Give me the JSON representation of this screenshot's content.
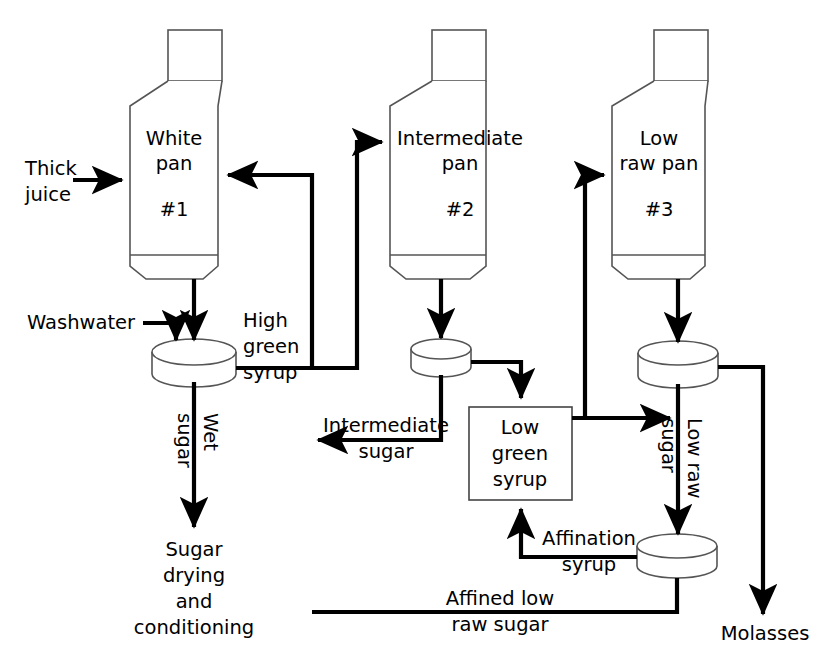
{
  "diagram": {
    "type": "process-flow-diagram",
    "colors": {
      "background": "#ffffff",
      "pipe": "#000000",
      "vessel_stroke": "#555555",
      "text": "#000000"
    },
    "vessels": [
      {
        "id": "white-pan",
        "name_line1": "White",
        "name_line2": "pan",
        "number": "#1",
        "shape": "vacuum-pan"
      },
      {
        "id": "intermediate-pan",
        "name_line1": "Intermediate",
        "name_line2": "pan",
        "number": "#2",
        "shape": "vacuum-pan"
      },
      {
        "id": "low-raw-pan",
        "name_line1": "Low",
        "name_line2": "raw pan",
        "number": "#3",
        "shape": "vacuum-pan"
      }
    ],
    "centrifuges": [
      {
        "id": "centrifuge-1",
        "label": ""
      },
      {
        "id": "centrifuge-2",
        "label": ""
      },
      {
        "id": "centrifuge-3",
        "label": ""
      },
      {
        "id": "affination-centrifuge",
        "label": ""
      }
    ],
    "boxes": [
      {
        "id": "low-green-syrup",
        "line1": "Low",
        "line2": "green",
        "line3": "syrup"
      }
    ],
    "streams": [
      {
        "id": "thick-juice",
        "line1": "Thick",
        "line2": "juice",
        "orientation": "horizontal"
      },
      {
        "id": "washwater",
        "text": "Washwater",
        "orientation": "horizontal"
      },
      {
        "id": "high-green-syrup",
        "line1": "High",
        "line2": "green",
        "line3": "syrup",
        "orientation": "horizontal"
      },
      {
        "id": "wet-sugar",
        "line1": "Wet",
        "line2": "sugar",
        "orientation": "vertical"
      },
      {
        "id": "sugar-drying",
        "line1": "Sugar",
        "line2": "drying",
        "line3": "and",
        "line4": "conditioning",
        "orientation": "horizontal"
      },
      {
        "id": "intermediate-sugar",
        "line1": "Intermediate",
        "line2": "sugar",
        "orientation": "horizontal"
      },
      {
        "id": "low-raw-sugar",
        "line1": "Low raw",
        "line2": "sugar",
        "orientation": "vertical"
      },
      {
        "id": "affination-syrup",
        "line1": "Affination",
        "line2": "syrup",
        "orientation": "horizontal"
      },
      {
        "id": "affined-low-raw-sugar",
        "line1": "Affined low",
        "line2": "raw sugar",
        "orientation": "horizontal"
      },
      {
        "id": "molasses",
        "text": "Molasses",
        "orientation": "horizontal"
      }
    ]
  }
}
